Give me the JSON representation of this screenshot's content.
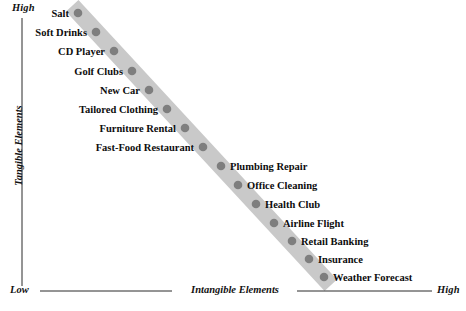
{
  "chart_data": {
    "type": "scatter",
    "title": "",
    "xlabel": "Intangible Elements",
    "ylabel": "Tangible Elements",
    "x_axis": {
      "title": "Intangible Elements",
      "low_label": "Low",
      "high_label": "High"
    },
    "y_axis": {
      "title": "Tangible Elements",
      "low_label": "Low",
      "high_label": "High"
    },
    "grid": false,
    "legend": "none",
    "annotation": "Points fall along a single descending diagonal band from high-tangible/low-intangible (Salt) to low-tangible/high-intangible (Weather Forecast).",
    "band": {
      "color": "#c9c9c9",
      "start": {
        "x": 78,
        "y": 12
      },
      "end": {
        "x": 325,
        "y": 279
      }
    },
    "point_color": "#7e7e7e",
    "points": [
      {
        "label": "Salt",
        "x": 78,
        "y": 13,
        "label_side": "left",
        "tangible": "high",
        "intangible": "low"
      },
      {
        "label": "Soft Drinks",
        "x": 96,
        "y": 32,
        "label_side": "left",
        "tangible": "high",
        "intangible": "low"
      },
      {
        "label": "CD Player",
        "x": 114,
        "y": 51,
        "label_side": "left",
        "tangible": "high",
        "intangible": "low"
      },
      {
        "label": "Golf Clubs",
        "x": 132,
        "y": 71,
        "label_side": "left",
        "tangible": "high",
        "intangible": "low"
      },
      {
        "label": "New Car",
        "x": 149,
        "y": 90,
        "label_side": "left",
        "tangible": "high",
        "intangible": "low"
      },
      {
        "label": "Tailored Clothing",
        "x": 167,
        "y": 109,
        "label_side": "left",
        "tangible": "med-high",
        "intangible": "med-low"
      },
      {
        "label": "Furniture Rental",
        "x": 185,
        "y": 128,
        "label_side": "left",
        "tangible": "med-high",
        "intangible": "med-low"
      },
      {
        "label": "Fast-Food Restaurant",
        "x": 203,
        "y": 147,
        "label_side": "left",
        "tangible": "medium",
        "intangible": "medium"
      },
      {
        "label": "Plumbing Repair",
        "x": 221,
        "y": 166,
        "label_side": "right",
        "tangible": "med-low",
        "intangible": "med-high"
      },
      {
        "label": "Office Cleaning",
        "x": 238,
        "y": 185,
        "label_side": "right",
        "tangible": "med-low",
        "intangible": "med-high"
      },
      {
        "label": "Health Club",
        "x": 256,
        "y": 204,
        "label_side": "right",
        "tangible": "low",
        "intangible": "high"
      },
      {
        "label": "Airline Flight",
        "x": 274,
        "y": 223,
        "label_side": "right",
        "tangible": "low",
        "intangible": "high"
      },
      {
        "label": "Retail Banking",
        "x": 292,
        "y": 241,
        "label_side": "right",
        "tangible": "low",
        "intangible": "high"
      },
      {
        "label": "Insurance",
        "x": 309,
        "y": 259,
        "label_side": "right",
        "tangible": "low",
        "intangible": "high"
      },
      {
        "label": "Weather Forecast",
        "x": 324,
        "y": 277,
        "label_side": "right",
        "tangible": "low",
        "intangible": "high"
      }
    ]
  },
  "colors": {
    "axis": "#2a2a2a",
    "band": "#c9c9c9",
    "point": "#7e7e7e",
    "text": "#0d0d0d",
    "background": "#ffffff"
  }
}
